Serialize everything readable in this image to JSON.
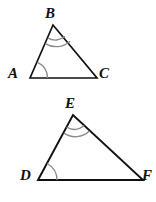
{
  "figure": {
    "kind": "two-similar-triangles-diagram",
    "background_color": "#ffffff",
    "edge_color": "#111111",
    "arc_color": "#8a8a8a",
    "label_color": "#111111"
  },
  "triangles": [
    {
      "name": "triangle-ABC",
      "vertices": [
        {
          "label": "A",
          "x": 30,
          "y": 78,
          "arcs": 1
        },
        {
          "label": "B",
          "x": 53,
          "y": 25,
          "arcs": 2
        },
        {
          "label": "C",
          "x": 97,
          "y": 78,
          "arcs": 0
        }
      ]
    },
    {
      "name": "triangle-DEF",
      "vertices": [
        {
          "label": "D",
          "x": 38,
          "y": 180,
          "arcs": 1
        },
        {
          "label": "E",
          "x": 73,
          "y": 115,
          "arcs": 2
        },
        {
          "label": "F",
          "x": 143,
          "y": 180,
          "arcs": 0
        }
      ]
    }
  ],
  "labels": {
    "A": "A",
    "B": "B",
    "C": "C",
    "D": "D",
    "E": "E",
    "F": "F"
  }
}
